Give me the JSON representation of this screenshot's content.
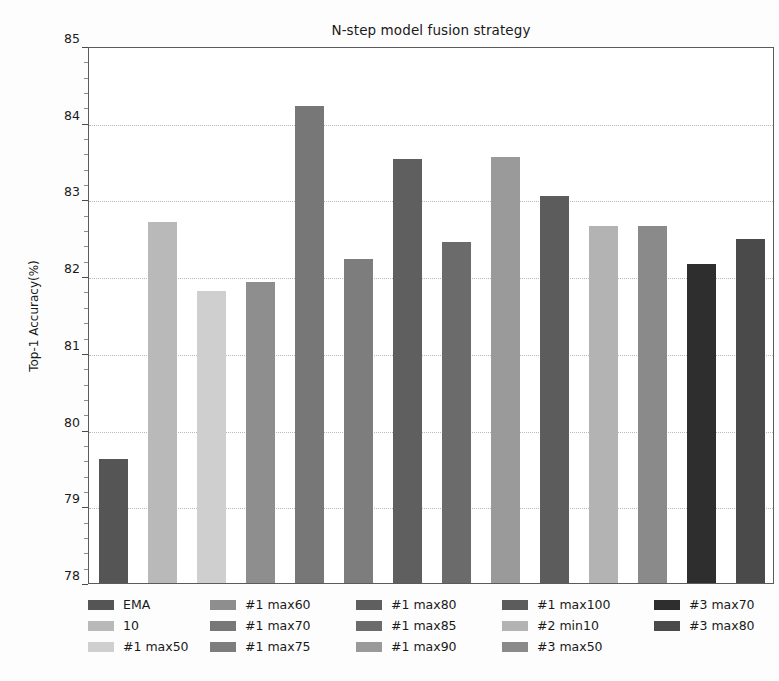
{
  "chart_data": {
    "type": "bar",
    "title": "N-step model fusion strategy",
    "xlabel": "",
    "ylabel": "Top-1 Accuracy(%)",
    "ylim": [
      78,
      85
    ],
    "ytick_labels": [
      "78",
      "79",
      "80",
      "81",
      "82",
      "83",
      "84",
      "85"
    ],
    "ytick_values": [
      78,
      79,
      80,
      81,
      82,
      83,
      84,
      85
    ],
    "grid": true,
    "grid_axis": "y",
    "legend_position": "below",
    "categories": [
      "EMA",
      "10",
      "#1 max50",
      "#1 max60",
      "#1 max70",
      "#1 max75",
      "#1 max80",
      "#1 max85",
      "#1 max90",
      "#1 max100",
      "#2 min10",
      "#3 max50",
      "#3 max70",
      "#3 max80"
    ],
    "values": [
      79.62,
      82.7,
      81.81,
      81.92,
      84.22,
      82.23,
      83.53,
      82.44,
      83.55,
      83.04,
      82.65,
      82.66,
      82.16,
      82.48
    ],
    "bar_colors": [
      "#555555",
      "#b9b9b9",
      "#cfcfcf",
      "#8e8e8e",
      "#777777",
      "#7d7d7d",
      "#5f5f5f",
      "#6b6b6b",
      "#9a9a9a",
      "#5c5c5c",
      "#b3b3b3",
      "#8a8a8a",
      "#2e2e2e",
      "#4a4a4a"
    ]
  },
  "legend": {
    "columns": [
      {
        "entries": [
          {
            "label": "EMA",
            "color": "#555555"
          },
          {
            "label": "10",
            "color": "#b9b9b9"
          },
          {
            "label": "#1 max50",
            "color": "#cfcfcf"
          }
        ]
      },
      {
        "entries": [
          {
            "label": "#1 max60",
            "color": "#8e8e8e"
          },
          {
            "label": "#1 max70",
            "color": "#777777"
          },
          {
            "label": "#1 max75",
            "color": "#7d7d7d"
          }
        ]
      },
      {
        "entries": [
          {
            "label": "#1 max80",
            "color": "#5f5f5f"
          },
          {
            "label": "#1 max85",
            "color": "#6b6b6b"
          },
          {
            "label": "#1 max90",
            "color": "#9a9a9a"
          }
        ]
      },
      {
        "entries": [
          {
            "label": "#1 max100",
            "color": "#5c5c5c"
          },
          {
            "label": "#2 min10",
            "color": "#b3b3b3"
          },
          {
            "label": "#3 max50",
            "color": "#8a8a8a"
          }
        ]
      },
      {
        "entries": [
          {
            "label": "#3 max70",
            "color": "#2e2e2e"
          },
          {
            "label": "#3 max80",
            "color": "#4a4a4a"
          }
        ]
      }
    ]
  }
}
